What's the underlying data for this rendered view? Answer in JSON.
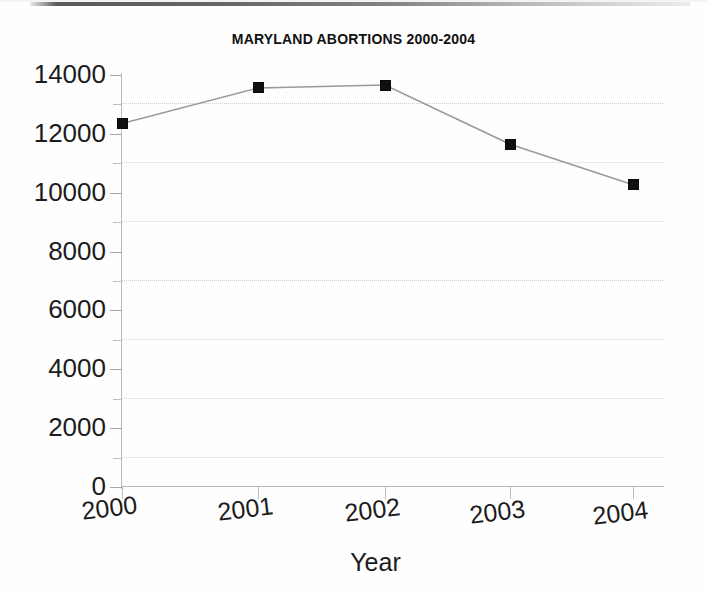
{
  "chart_data": {
    "type": "line",
    "title": "MARYLAND ABORTIONS 2000-2004",
    "xlabel": "Year",
    "ylabel": "",
    "categories": [
      "2000",
      "2001",
      "2002",
      "2003",
      "2004"
    ],
    "values": [
      12350,
      13560,
      13660,
      11650,
      10270
    ],
    "series": [
      {
        "name": "Maryland abortions",
        "values": [
          12350,
          13560,
          13660,
          11650,
          10270
        ]
      }
    ],
    "ylim": [
      0,
      14000
    ],
    "ytick_labels": [
      "0",
      "2000",
      "4000",
      "6000",
      "8000",
      "10000",
      "12000",
      "14000"
    ],
    "ytick_values": [
      0,
      2000,
      4000,
      6000,
      8000,
      10000,
      12000,
      14000
    ],
    "yminor_tick_values": [
      1000,
      3000,
      5000,
      7000,
      9000,
      11000,
      13000
    ],
    "gridline_values": [
      1000,
      3000,
      5000,
      7000,
      9000,
      11000,
      13000
    ],
    "grid": "horizontal-dotted-minor",
    "legend": "none",
    "marker": "filled-square",
    "marker_color": "#101010",
    "line_color": "#9a9a9a",
    "background_color": "#ffffff",
    "text_color": "#1c1c1c"
  }
}
